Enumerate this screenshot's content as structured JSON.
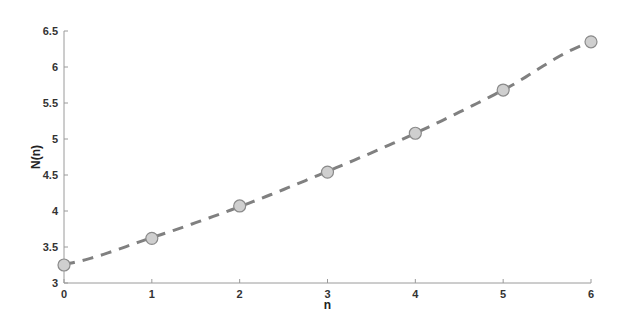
{
  "chart_data": {
    "type": "line",
    "title": "",
    "xlabel": "n",
    "ylabel": "N(n)",
    "xlim": [
      0,
      6
    ],
    "ylim": [
      3,
      6.5
    ],
    "x_ticks": [
      0,
      1,
      2,
      3,
      4,
      5,
      6
    ],
    "x_tick_labels": [
      "0",
      "1",
      "2",
      "3",
      "4",
      "5",
      "6"
    ],
    "y_ticks": [
      3,
      3.5,
      4,
      4.5,
      5,
      5.5,
      6,
      6.5
    ],
    "y_tick_labels": [
      "3",
      "3.5",
      "4",
      "4.5",
      "5",
      "5.5",
      "6",
      "6.5"
    ],
    "grid": false,
    "legend": null,
    "series": [
      {
        "name": "data points",
        "style": "markers",
        "marker": "circle",
        "x": [
          0,
          1,
          2,
          3,
          4,
          5,
          6
        ],
        "values": [
          3.25,
          3.62,
          4.07,
          4.54,
          5.08,
          5.68,
          6.35
        ]
      },
      {
        "name": "fit",
        "style": "dashed-line",
        "x": [
          0,
          1,
          2,
          3,
          4,
          5,
          6
        ],
        "values": [
          3.26,
          3.63,
          4.06,
          4.55,
          5.08,
          5.68,
          6.34
        ]
      }
    ],
    "colors": {
      "line": "#808080",
      "marker_fill": "#cfcfcf",
      "marker_edge": "#8a8a8a",
      "axis": "#9a9a9a"
    }
  }
}
